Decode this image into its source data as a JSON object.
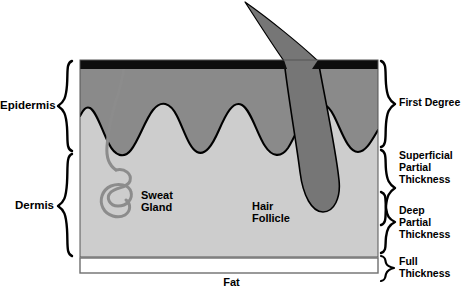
{
  "figure": {
    "width": 463,
    "height": 296
  },
  "colors": {
    "background": "#ffffff",
    "stratum_corneum": "#0d0d0d",
    "epidermis_fill": "#8a8a8a",
    "dermis_fill": "#cdcdcd",
    "hair_fill": "#767676",
    "follicle_fill": "#767676",
    "sweat_gland_stroke": "#8c8c8c",
    "fat_fill": "#ffffff",
    "outline": "#000000",
    "text": "#000000"
  },
  "left_labels": [
    {
      "id": "epidermis",
      "text": "Epidermis"
    },
    {
      "id": "dermis",
      "text": "Dermis"
    }
  ],
  "right_labels": [
    {
      "id": "first-degree",
      "text": "First Degree"
    },
    {
      "id": "superficial-partial-thickness",
      "text": "Superficial\nPartial\nThickness"
    },
    {
      "id": "deep-partial-thickness",
      "text": "Deep\nPartial\nThickness"
    },
    {
      "id": "full-thickness",
      "text": "Full\nThickness"
    }
  ],
  "inner_labels": [
    {
      "id": "sweat-gland",
      "text": "Sweat\nGland"
    },
    {
      "id": "hair-follicle",
      "text": "Hair\nFollicle"
    }
  ],
  "bottom_labels": [
    {
      "id": "fat",
      "text": "Fat"
    }
  ]
}
